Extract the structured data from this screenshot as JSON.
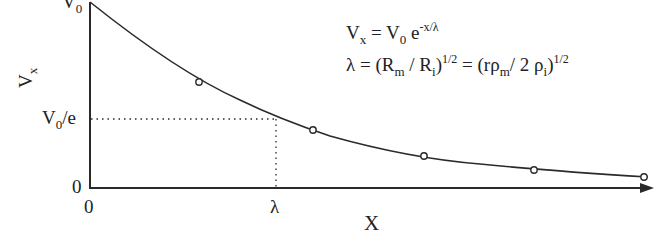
{
  "diagram": {
    "type": "exponential-decay-plot",
    "y_axis": {
      "label_main": "V",
      "label_sub": "x",
      "ticks": {
        "top": {
          "main": "V",
          "sub": "0"
        },
        "mid": {
          "main": "V",
          "sub": "0",
          "rest": "/e"
        },
        "zero": "0"
      }
    },
    "x_axis": {
      "label": "X",
      "ticks": {
        "zero": "0",
        "lambda": "λ"
      }
    },
    "equations": {
      "eq1": {
        "lhs_main": "V",
        "lhs_sub": "x",
        "eq": " = V",
        "v0_sub": "0",
        "e": " e",
        "exp": "-x/λ"
      },
      "eq2": {
        "lam": "λ = (R",
        "rm_sub": "m",
        "mid": " / R",
        "ri_sub": "i",
        "close1": ")",
        "exp1": "1/2",
        "eq": " = (rρ",
        "rho_m_sub": "m",
        "mid2": "/ 2 ρ",
        "rho_i_sub": "i",
        "close2": ")",
        "exp2": "1/2"
      }
    },
    "markers": [
      {
        "x": 199,
        "y": 82
      },
      {
        "x": 313,
        "y": 130
      },
      {
        "x": 424,
        "y": 156
      },
      {
        "x": 534,
        "y": 170
      },
      {
        "x": 644,
        "y": 177
      }
    ],
    "colors": {
      "line": "#2a2a2a",
      "background": "#ffffff"
    }
  }
}
